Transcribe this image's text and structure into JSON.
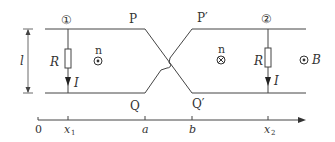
{
  "diagram": {
    "rail_labels": {
      "P": "P",
      "P_prime": "P′",
      "Q": "Q",
      "Q_prime": "Q′"
    },
    "positions": {
      "pos1": "①",
      "pos2": "②"
    },
    "resistors": [
      {
        "label": "R",
        "current_label": "I"
      },
      {
        "label": "R",
        "current_label": "I"
      }
    ],
    "normals": {
      "left": {
        "label": "n",
        "symbol": "out-of-page"
      },
      "right": {
        "label": "n",
        "symbol": "into-page"
      }
    },
    "field": {
      "label": "B",
      "symbol": "out-of-page"
    },
    "width_label": "l",
    "axis": {
      "ticks": [
        "0",
        "x",
        "a",
        "b",
        "x"
      ],
      "subscripts": [
        "",
        "1",
        "",
        "",
        "2"
      ]
    }
  }
}
